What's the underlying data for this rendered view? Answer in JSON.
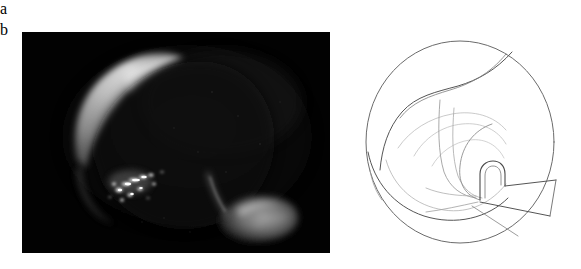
{
  "figure": {
    "background_color": "#ffffff",
    "width": 581,
    "height": 269,
    "panel_count": 2
  },
  "panels": [
    {
      "id": "a",
      "label": "a",
      "label_box_color": "#e9e9e9",
      "label_text_color": "#111111",
      "kind": "photograph",
      "description": "Dark endoscopic photographic frame",
      "background_color": "#030303",
      "bounds": {
        "x": 22,
        "y": 32,
        "width": 308,
        "height": 221
      },
      "features": [
        {
          "name": "bright-crescent-arc",
          "description": "Soft glowing crescent along the upper-left curvature",
          "color": "#c9c9c9",
          "peak_brightness": "#e3e3e3"
        },
        {
          "name": "bright-speckle-cluster",
          "description": "Diagonal cluster of small intense white specks at left-lower-center",
          "color": "#ffffff"
        },
        {
          "name": "dim-tongue-blob",
          "description": "Dim grey flap-shaped structure at lower right",
          "color": "#8c8c8c"
        },
        {
          "name": "thin-streak",
          "description": "Faint thin streak rising up-left from the flap",
          "color": "#6a6a6a"
        },
        {
          "name": "faint-tissue-haze",
          "description": "Very faint mottled grey haze filling the right half",
          "color": "#1a1a1a"
        }
      ]
    },
    {
      "id": "b",
      "label": "b",
      "label_box_color": "#e9e9e9",
      "label_text_color": "#111111",
      "kind": "line-drawing",
      "description": "Circular schematic line drawing of the endoscopic view shown in panel a",
      "background_color": "#ffffff",
      "line_color": "#555555",
      "light_line_color": "#a8a8a8",
      "bounds": {
        "x": 340,
        "y": 30,
        "width": 241,
        "height": 226
      },
      "features": [
        {
          "name": "outer-circle",
          "description": "Circular field-of-view boundary",
          "color": "#666666"
        },
        {
          "name": "upper-fold-contour",
          "description": "Large contour sweeping from upper-left across the top",
          "color": "#555555"
        },
        {
          "name": "lower-fold-contour",
          "description": "Large contour sweeping along the lower-left inner edge",
          "color": "#555555"
        },
        {
          "name": "inner-fold-lines",
          "description": "Faint concentric inner fold lines converging toward the centre",
          "color": "#b0b0b0"
        },
        {
          "name": "hook-loop",
          "description": "Small hook / loop structure at the centre-right",
          "color": "#4a4a4a"
        },
        {
          "name": "radiating-lines",
          "description": "Straight lines radiating toward the lower-right from the hook",
          "color": "#555555"
        }
      ]
    }
  ]
}
